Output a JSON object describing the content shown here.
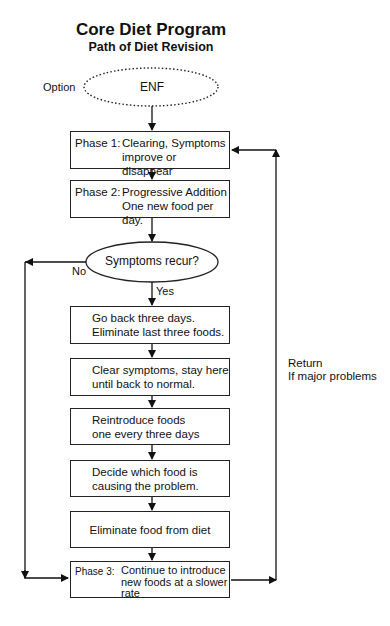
{
  "title": "Core Diet Program",
  "subtitle": "Path of Diet Revision",
  "start": {
    "option_label": "Option",
    "text": "ENF"
  },
  "phase1": {
    "phase": "Phase 1:",
    "line1": "Clearing, Symptoms",
    "line2": "improve or disappear"
  },
  "phase2": {
    "phase": "Phase 2:",
    "line1": "Progressive Addition",
    "line2": "One new food per day."
  },
  "decision": {
    "text": "Symptoms recur?",
    "no_label": "No",
    "yes_label": "Yes"
  },
  "steps": [
    {
      "line1": "Go back three days.",
      "line2": "Eliminate last three foods."
    },
    {
      "line1": "Clear symptoms, stay here",
      "line2": "until back to normal."
    },
    {
      "line1": "Reintroduce foods",
      "line2": "one every three days"
    },
    {
      "line1": "Decide which food is",
      "line2": "causing the problem."
    },
    {
      "line1": "Eliminate food from diet"
    }
  ],
  "phase3": {
    "phase": "Phase 3:",
    "line1": "Continue to introduce",
    "line2": "new foods at a slower",
    "line3": "rate"
  },
  "return_note": {
    "line1": "Return",
    "line2": "If major problems"
  }
}
